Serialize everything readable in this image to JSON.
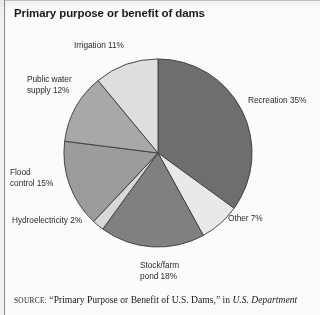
{
  "title": "Primary purpose or benefit of dams",
  "source": {
    "label": "SOURCE:",
    "text_plain": " “Primary Purpose or Benefit of U.S. Dams,” in ",
    "text_italic": "U.S. Department"
  },
  "labels": {
    "irrigation": "Irrigation 11%",
    "recreation": "Recreation 35%",
    "other": "Other 7%",
    "stock_farm_pond": "Stock/farm\npond 18%",
    "hydroelectricity": "Hydroelectricity 2%",
    "flood_control": "Flood\ncontrol 15%",
    "public_water_supply": "Public water\nsupply 12%"
  },
  "chart_data": {
    "type": "pie",
    "title": "Primary purpose or benefit of dams",
    "xlabel": "",
    "ylabel": "",
    "legend_position": "none",
    "grid": false,
    "start_angle_deg": 0,
    "direction": "clockwise",
    "units": "percent",
    "categories": [
      "Recreation",
      "Other",
      "Stock/farm pond",
      "Hydroelectricity",
      "Flood control",
      "Public water supply",
      "Irrigation"
    ],
    "values": [
      35,
      7,
      18,
      2,
      15,
      12,
      11
    ],
    "colors": [
      "#6e6e6e",
      "#e9e9e7",
      "#808080",
      "#d8d8d6",
      "#9c9c9c",
      "#a8a8a8",
      "#dededc"
    ],
    "slice_label_text": [
      "Recreation 35%",
      "Other 7%",
      "Stock/farm pond 18%",
      "Hydroelectricity 2%",
      "Flood control 15%",
      "Public water supply 12%",
      "Irrigation 11%"
    ],
    "stroke_color": "#3f3f3f"
  }
}
